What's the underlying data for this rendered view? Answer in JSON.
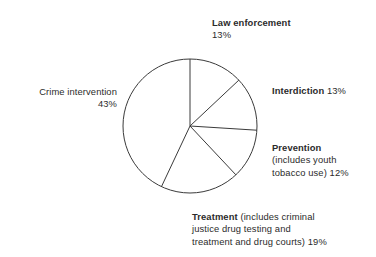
{
  "chart_data": {
    "type": "pie",
    "title": "",
    "subtitle": "",
    "xlabel": "",
    "ylabel": "",
    "legend_position": "none",
    "grid": false,
    "units": "percent",
    "start_angle_deg": 0,
    "direction": "clockwise",
    "categories": [
      "Law enforcement",
      "Interdiction",
      "Prevention (includes youth tobacco use)",
      "Treatment (includes criminal justice drug testing and treatment and drug courts)",
      "Crime intervention"
    ],
    "values": [
      13,
      13,
      12,
      19,
      43
    ],
    "slices": [
      {
        "name": "Law enforcement",
        "value": 13,
        "value_label": "13%",
        "start_deg": 0,
        "end_deg": 46.8,
        "fill": "#ffffff",
        "stroke": "#3a3a3a"
      },
      {
        "name": "Interdiction",
        "value": 13,
        "value_label": "13%",
        "start_deg": 46.8,
        "end_deg": 93.6,
        "fill": "#ffffff",
        "stroke": "#3a3a3a"
      },
      {
        "name": "Prevention",
        "value": 12,
        "value_label": "12%",
        "start_deg": 93.6,
        "end_deg": 136.8,
        "fill": "#ffffff",
        "stroke": "#3a3a3a"
      },
      {
        "name": "Treatment",
        "value": 19,
        "value_label": "19%",
        "start_deg": 136.8,
        "end_deg": 205.2,
        "fill": "#ffffff",
        "stroke": "#3a3a3a"
      },
      {
        "name": "Crime intervention",
        "value": 43,
        "value_label": "43%",
        "start_deg": 205.2,
        "end_deg": 360,
        "fill": "#ffffff",
        "stroke": "#3a3a3a"
      }
    ]
  },
  "labels": {
    "law_enforcement": {
      "name": "Law enforcement",
      "percent": "13%"
    },
    "crime_intervention": {
      "name": "Crime intervention",
      "percent": "43%"
    },
    "interdiction": {
      "name": "Interdiction",
      "percent": "13%"
    },
    "prevention": {
      "name": "Prevention",
      "line2": "(includes youth",
      "line3": "tobacco use) 12%"
    },
    "treatment": {
      "name": "Treatment",
      "line1_rest": "(includes criminal",
      "line2": "justice drug testing and",
      "line3": "treatment and drug courts) 19%"
    }
  },
  "style": {
    "background": "#ffffff",
    "text_color": "#2b2b2b",
    "slice_stroke": "#3a3a3a",
    "slice_fill": "#ffffff"
  }
}
